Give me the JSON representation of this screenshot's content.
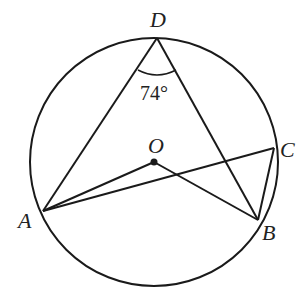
{
  "diagram": {
    "type": "inscribed-angle-circle",
    "stroke_color": "#1a1a1a",
    "circle": {
      "center": "O",
      "cx": 154,
      "cy": 162,
      "r": 124
    },
    "points": {
      "D": {
        "x": 157,
        "y": 38,
        "label": "D"
      },
      "A": {
        "x": 43,
        "y": 211,
        "label": "A"
      },
      "B": {
        "x": 258,
        "y": 220,
        "label": "B"
      },
      "C": {
        "x": 274,
        "y": 148,
        "label": "C"
      },
      "O": {
        "x": 154,
        "y": 162,
        "label": "O"
      }
    },
    "segments": [
      [
        "D",
        "A"
      ],
      [
        "D",
        "B"
      ],
      [
        "A",
        "O"
      ],
      [
        "O",
        "B"
      ],
      [
        "A",
        "C"
      ],
      [
        "C",
        "B"
      ]
    ],
    "angle_annotation": {
      "vertex": "D",
      "value": "74°"
    }
  }
}
